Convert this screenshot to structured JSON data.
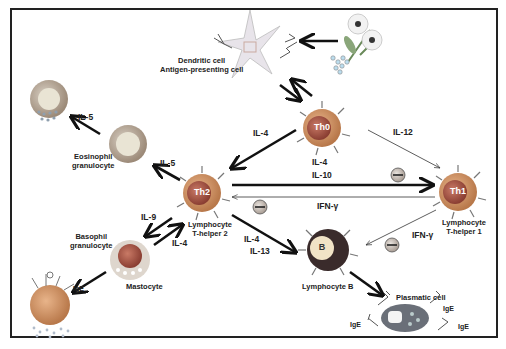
{
  "cells": {
    "dendritic": {
      "label_line1": "Dendritic cell",
      "label_line2": "Antigen-presenting cell"
    },
    "th0": {
      "name": "Th0"
    },
    "th1": {
      "name": "Th1",
      "label_line1": "Lymphocyte",
      "label_line2": "T-helper 1"
    },
    "th2": {
      "name": "Th2",
      "label_line1": "Lymphocyte",
      "label_line2": "T-helper 2"
    },
    "eosinophil": {
      "label_line1": "Eosinophil",
      "label_line2": "granulocyte"
    },
    "basophil": {
      "label_line1": "Basophil",
      "label_line2": "granulocyte"
    },
    "mastocyte": {
      "label": "Mastocyte"
    },
    "bcell": {
      "name": "B",
      "label": "Lymphocyte B"
    },
    "plasmatic": {
      "label": "Plasmatic cell"
    }
  },
  "cytokines": {
    "il5_top": "IL-5",
    "il5_eos": "IL-5",
    "il4_th0_th2": "IL-4",
    "il12": "IL-12",
    "il4_th2_th1": "IL-4",
    "il10": "IL-10",
    "ifng_th1_th2": "IFN-γ",
    "ifng_th1_b": "IFN-γ",
    "il9": "IL-9",
    "il4_mast": "IL-4",
    "il4_b": "IL-4",
    "il13": "IL-13"
  },
  "antibodies": {
    "ige1": "IgE",
    "ige2": "IgE",
    "ige3": "IgE",
    "ige4": "IgE",
    "ige_mast": "IgE"
  },
  "colors": {
    "cell_orange": "#c98f5a",
    "cell_core": "#a35a45",
    "arrow": "#111111",
    "inhibit": "#9c8f87"
  }
}
